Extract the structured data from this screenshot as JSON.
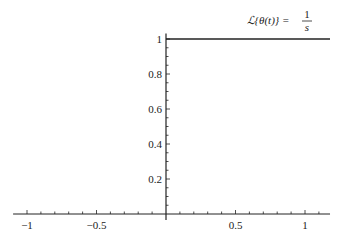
{
  "chart_data": {
    "type": "line",
    "title_parts": {
      "lhs": "ℒ{θ(t)} =",
      "numerator": "1",
      "denominator": "s"
    },
    "xlabel": "",
    "ylabel": "",
    "xlim": [
      -1.1,
      1.18
    ],
    "ylim": [
      0,
      1.02
    ],
    "grid": false,
    "legend": null,
    "x_ticks": [
      -1,
      -0.5,
      0.5,
      1
    ],
    "x_tick_labels": [
      "−1",
      "−0.5",
      "0.5",
      "1"
    ],
    "y_ticks": [
      0.2,
      0.4,
      0.6,
      0.8,
      1
    ],
    "y_tick_labels": [
      "0.2",
      "0.4",
      "0.6",
      "0.8",
      "1"
    ],
    "series": [
      {
        "name": "Unit step θ(t) Laplace transform annotation",
        "x": [
          0,
          1.18
        ],
        "y": [
          1,
          1
        ],
        "color": "#222222"
      }
    ]
  },
  "colors": {
    "axis": "#222222",
    "line": "#222222",
    "background": "#ffffff"
  }
}
